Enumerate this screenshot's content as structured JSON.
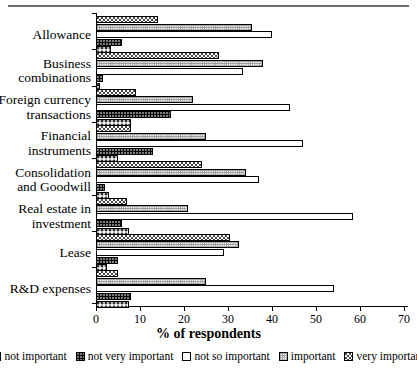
{
  "chart_data": {
    "type": "bar",
    "orientation": "horizontal",
    "title": "",
    "xlabel": "% of respondents",
    "ylabel": "",
    "xlim": [
      0,
      70
    ],
    "xticks": [
      0,
      10,
      20,
      30,
      40,
      50,
      60,
      70
    ],
    "grid": false,
    "legend_position": "bottom",
    "categories": [
      "Allowance",
      "Business\ncombinations",
      "Foreign currency\ntransactions",
      "Financial\ninstruments",
      "Consolidation\nand Goodwill",
      "Real estate in\ninvestment",
      "Lease",
      "R&D expenses"
    ],
    "series": [
      {
        "name": "not important",
        "pattern": "gray-dotted",
        "values": [
          3.5,
          1.0,
          8.0,
          5.0,
          3.0,
          7.5,
          2.5,
          7.5
        ]
      },
      {
        "name": "not very important",
        "pattern": "black-dotted",
        "values": [
          6.0,
          1.5,
          17.0,
          13.0,
          2.0,
          6.0,
          5.0,
          8.0
        ]
      },
      {
        "name": "not so important",
        "pattern": "white",
        "values": [
          40.0,
          33.5,
          44.0,
          47.0,
          37.0,
          58.5,
          29.0,
          54.0
        ]
      },
      {
        "name": "important",
        "pattern": "fine-grid",
        "values": [
          35.5,
          38.0,
          22.0,
          25.0,
          34.0,
          21.0,
          32.5,
          25.0
        ]
      },
      {
        "name": "very important",
        "pattern": "stipple",
        "values": [
          14.0,
          28.0,
          9.0,
          8.0,
          24.0,
          7.0,
          30.5,
          5.0
        ]
      }
    ]
  },
  "legend": {
    "items": [
      {
        "label": "not important"
      },
      {
        "label": "not very important"
      },
      {
        "label": "not so important"
      },
      {
        "label": "important"
      },
      {
        "label": "very important"
      }
    ]
  },
  "axis": {
    "x_title": "% of respondents"
  }
}
